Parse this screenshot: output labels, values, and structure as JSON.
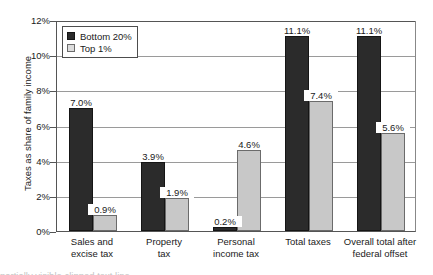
{
  "chart_data": {
    "type": "bar",
    "title": "",
    "subtitle": "",
    "xlabel": "",
    "ylabel": "Taxes as share of family income",
    "ylim": [
      0,
      12
    ],
    "ytick_labels": [
      "0%",
      "2%",
      "4%",
      "6%",
      "8%",
      "10%",
      "12%"
    ],
    "ytick_values": [
      0,
      2,
      4,
      6,
      8,
      10,
      12
    ],
    "grid": true,
    "legend_position": "top-left",
    "categories": [
      "Sales and excise tax",
      "Property tax",
      "Personal income tax",
      "Total taxes",
      "Overall total after federal offset"
    ],
    "category_lines": [
      [
        "Sales and",
        "excise tax"
      ],
      [
        "Property",
        "tax"
      ],
      [
        "Personal",
        "income tax"
      ],
      [
        "Total taxes",
        ""
      ],
      [
        "Overall total after",
        "federal offset"
      ]
    ],
    "series": [
      {
        "name": "Bottom 20%",
        "color": "#2b2b2b",
        "values": [
          7.0,
          3.9,
          0.2,
          11.1,
          11.1
        ],
        "labels": [
          "7.0%",
          "3.9%",
          "0.2%",
          "11.1%",
          "11.1%"
        ]
      },
      {
        "name": "Top 1%",
        "color": "#c8c8c8",
        "values": [
          0.9,
          1.9,
          4.6,
          7.4,
          5.6
        ],
        "labels": [
          "0.9%",
          "1.9%",
          "4.6%",
          "7.4%",
          "5.6%"
        ]
      }
    ]
  },
  "legend": {
    "items": [
      {
        "label": "Bottom 20%",
        "swatch": "dark"
      },
      {
        "label": "Top 1%",
        "swatch": "light"
      }
    ]
  },
  "caption_clip": "partially visible clipped text line"
}
